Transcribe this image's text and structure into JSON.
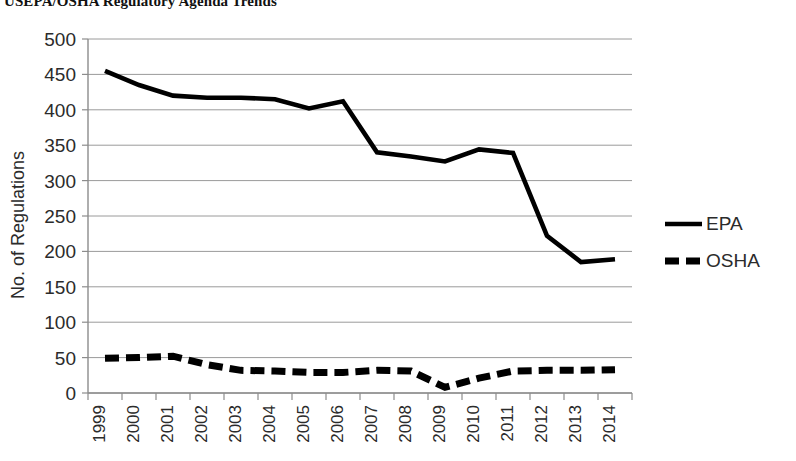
{
  "chart_data": {
    "type": "line",
    "title": "USEPA/OSHA Regulatory Agenda Trends",
    "xlabel": "",
    "ylabel": "No. of Regulations",
    "ylim": [
      0,
      500
    ],
    "ytick_step": 50,
    "yticks": [
      "500",
      "450",
      "400",
      "350",
      "300",
      "250",
      "200",
      "150",
      "100",
      "50",
      "0"
    ],
    "grid": true,
    "legend_position": "right",
    "categories": [
      "1999",
      "2000",
      "2001",
      "2002",
      "2003",
      "2004",
      "2005",
      "2006",
      "2007",
      "2008",
      "2009",
      "2010",
      "2011",
      "2012",
      "2013",
      "2014"
    ],
    "series": [
      {
        "name": "EPA",
        "style": "solid",
        "color": "#000000",
        "values": [
          455,
          435,
          420,
          417,
          417,
          415,
          402,
          412,
          340,
          334,
          327,
          344,
          339,
          222,
          185,
          189
        ]
      },
      {
        "name": "OSHA",
        "style": "dashed",
        "color": "#000000",
        "values": [
          49,
          50,
          52,
          40,
          32,
          31,
          29,
          29,
          32,
          31,
          8,
          21,
          31,
          32,
          32,
          33
        ]
      }
    ]
  },
  "legend": {
    "items": [
      {
        "label": "EPA"
      },
      {
        "label": "OSHA"
      }
    ]
  },
  "axes": {
    "y_axis_title": "No. of Regulations"
  }
}
